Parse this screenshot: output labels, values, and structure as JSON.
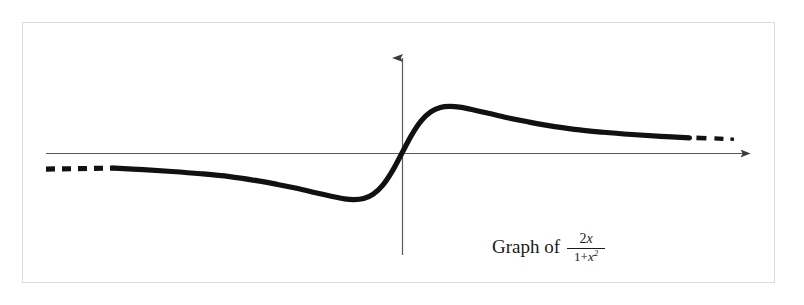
{
  "figure": {
    "caption_prefix": "Graph of",
    "fraction": {
      "numerator_coefficient": "2",
      "numerator_variable": "x",
      "denominator_constant": "1+",
      "denominator_variable": "x",
      "denominator_exponent": "2"
    },
    "frame_color": "#dcdcdc",
    "background_color": "#ffffff",
    "curve_color": "#111111",
    "axis_color": "#555555"
  },
  "chart_data": {
    "type": "line",
    "function": "y = 2x / (1 + x^2)",
    "xlabel": "x",
    "ylabel": "y",
    "grid": false,
    "legend": null,
    "axes": {
      "x_axis_shown": true,
      "y_axis_shown": true,
      "x_axis_arrow": "right",
      "y_axis_arrow": "up",
      "origin_px": [
        402,
        153
      ],
      "x_axis_span_px": [
        46,
        755
      ],
      "y_axis_span_px": [
        52,
        255
      ],
      "ticks": [],
      "tick_labels": []
    },
    "xlim": [
      -7.2,
      7.6
    ],
    "ylim": [
      -1.35,
      1.8
    ],
    "dashed_tails": {
      "left": true,
      "right": true,
      "note": "curve drawn dashed at both far ends indicating continuation toward the horizontal asymptote y = 0"
    },
    "features": {
      "maximum": {
        "x": 1,
        "y": 1,
        "px": [
          455,
          102
        ]
      },
      "minimum": {
        "x": -1,
        "y": -1,
        "px": [
          350,
          205
        ]
      },
      "root": {
        "x": 0,
        "y": 0,
        "px": [
          402,
          153
        ]
      },
      "asymptote": {
        "y": 0
      }
    },
    "x": [
      -7.2,
      -6.6,
      -6.0,
      -5.4,
      -4.8,
      -4.2,
      -3.6,
      -3.0,
      -2.6,
      -2.2,
      -1.8,
      -1.5,
      -1.2,
      -1.0,
      -0.8,
      -0.6,
      -0.4,
      -0.2,
      0.0,
      0.2,
      0.4,
      0.6,
      0.8,
      1.0,
      1.2,
      1.5,
      1.8,
      2.2,
      2.6,
      3.0,
      3.6,
      4.2,
      4.8,
      5.4,
      6.0,
      6.6,
      7.2,
      7.6
    ],
    "values": [
      -0.272,
      -0.296,
      -0.324,
      -0.357,
      -0.397,
      -0.446,
      -0.508,
      -0.6,
      -0.675,
      -0.758,
      -0.853,
      -0.923,
      -0.984,
      -1.0,
      -0.976,
      -0.882,
      -0.69,
      -0.385,
      0.0,
      0.385,
      0.69,
      0.882,
      0.976,
      1.0,
      0.984,
      0.923,
      0.853,
      0.758,
      0.675,
      0.6,
      0.508,
      0.446,
      0.397,
      0.357,
      0.324,
      0.296,
      0.272,
      0.259
    ]
  }
}
